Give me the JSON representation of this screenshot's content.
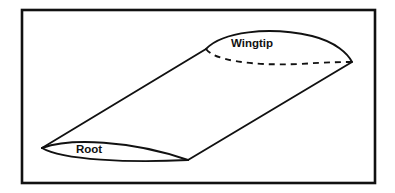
{
  "figure": {
    "name": "wing-planform-3d-diagram",
    "background_color": "#ffffff",
    "line_color": "#111111",
    "frame": {
      "name": "figure-border",
      "x": 22,
      "y": 10,
      "width": 353,
      "height": 173,
      "stroke_width": 2.6
    },
    "labels": [
      {
        "id": "wingtip",
        "text": "Wingtip",
        "x": 252,
        "y": 47,
        "anchor": "middle"
      },
      {
        "id": "root",
        "text": "Root",
        "x": 89,
        "y": 153,
        "anchor": "middle"
      }
    ],
    "geometry": {
      "root_leading_edge": [
        42,
        148
      ],
      "root_trailing_edge": [
        188,
        160
      ],
      "tip_leading_edge": [
        206,
        49
      ],
      "tip_trailing_edge": [
        352,
        62
      ],
      "root_section_upper": "M42,148 C70,138 130,140 188,160",
      "root_section_lower": "M42,148 C62,160 130,163 188,160",
      "tip_section_upper": "M206,49 C222,32 268,26 312,36 C336,42 348,54 352,62",
      "tip_section_hidden_lower": "M206,49 C214,60 250,66 300,64 C328,62 346,62 352,62",
      "leading_edge_line": "M42,148 L206,49",
      "trailing_edge_line": "M188,160 L352,62",
      "upper_surface_fill": "M42,148 C70,138 130,140 188,160 L352,62 C348,54 336,42 312,36 C268,26 222,32 206,49 Z"
    }
  }
}
